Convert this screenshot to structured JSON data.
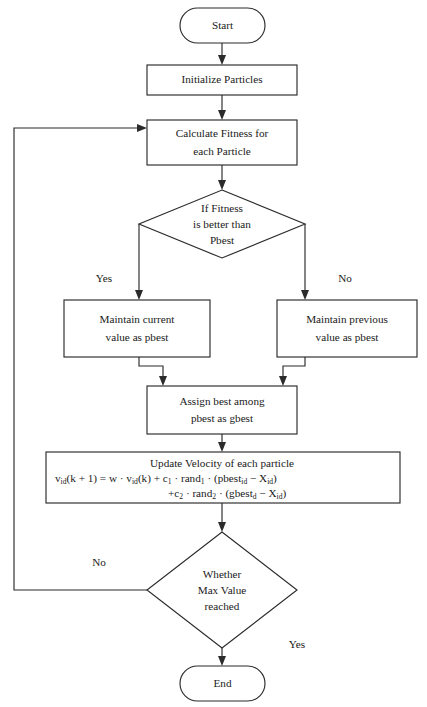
{
  "diagram": {
    "stroke_color": "#2b2b2b",
    "fill_color": "#ffffff",
    "text_color": "#1a1a1a"
  },
  "nodes": {
    "start": {
      "label": "Start",
      "shape": "terminator"
    },
    "initialize": {
      "label": "Initialize Particles",
      "shape": "process"
    },
    "calculate_fitness": {
      "line1": "Calculate Fitness for",
      "line2": "each Particle",
      "shape": "process"
    },
    "fitness_decision": {
      "line1": "If Fitness",
      "line2": "is better than",
      "line3": "Pbest",
      "shape": "decision"
    },
    "maintain_current": {
      "line1": "Maintain current",
      "line2": "value as pbest",
      "shape": "process"
    },
    "maintain_previous": {
      "line1": "Maintain previous",
      "line2": "value as pbest",
      "shape": "process"
    },
    "assign_gbest": {
      "line1": "Assign best among",
      "line2": "pbest as gbest",
      "shape": "process"
    },
    "update_velocity": {
      "title": "Update Velocity of each particle",
      "formula_line1": {
        "p1": "v",
        "s1": "id",
        "p2": "(k + 1) = w · v",
        "s2": "id",
        "p3": "(k) + c",
        "s3": "1",
        "p4": " · rand",
        "s4": "1",
        "p5": " · (pbest",
        "s5": "id",
        "p6": " − X",
        "s6": "id",
        "p7": ")"
      },
      "formula_line2": {
        "p1": "+c",
        "s1": "2",
        "p2": " · rand",
        "s2": "2",
        "p3": " · (gbest",
        "s3": "d",
        "p4": " − X",
        "s4": "id",
        "p5": ")"
      },
      "shape": "process"
    },
    "max_value_decision": {
      "line1": "Whether",
      "line2": "Max Value",
      "line3": "reached",
      "shape": "decision"
    },
    "end": {
      "label": "End",
      "shape": "terminator"
    }
  },
  "edge_labels": {
    "fitness_yes": "Yes",
    "fitness_no": "No",
    "max_value_no": "No",
    "max_value_yes": "Yes"
  }
}
